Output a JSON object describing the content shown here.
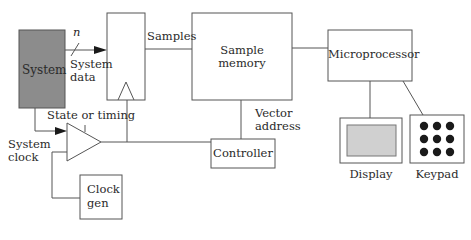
{
  "diagram": {
    "blocks": {
      "system": {
        "label": "System",
        "fill": "#8c8c8c"
      },
      "register": {
        "label": ""
      },
      "sample_memory": {
        "line1": "Sample",
        "line2": "memory"
      },
      "microprocessor": {
        "label": "Microprocessor"
      },
      "controller": {
        "label": "Controller"
      },
      "clock_gen": {
        "line1": "Clock",
        "line2": "gen"
      },
      "display": {
        "label": "Display",
        "screen_fill": "#d0d0d0"
      },
      "keypad": {
        "label": "Keypad",
        "keys": 9
      }
    },
    "signals": {
      "bus_width": "n",
      "system_data_line1": "System",
      "system_data_line2": "data",
      "samples": "Samples",
      "state_or_timing": "State or timing",
      "system_clock_line1": "System",
      "system_clock_line2": "clock",
      "vector_address_line1": "Vector",
      "vector_address_line2": "address"
    },
    "colors": {
      "stroke": "#555555",
      "text": "#2a2a2a",
      "arrow": "#1a1a1a"
    }
  }
}
